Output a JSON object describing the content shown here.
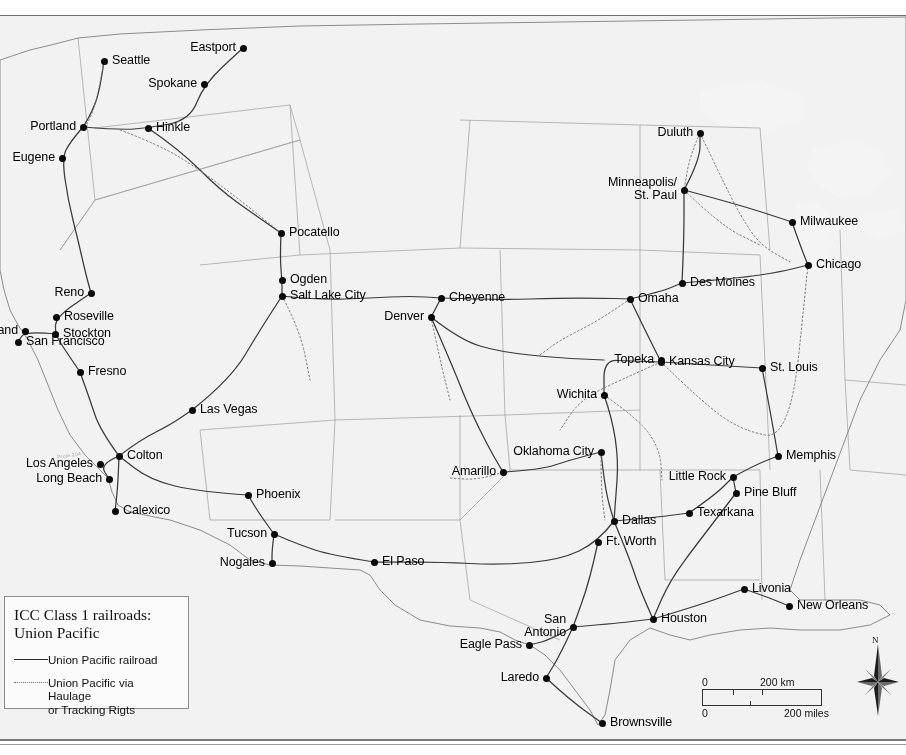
{
  "map": {
    "title": "ICC Class 1 railroads: Union Pacific",
    "projection_note": "United States rail network map with shaded relief",
    "watermark": "Proje 204"
  },
  "legend": {
    "title": "ICC Class 1 railroads:\nUnion Pacific",
    "entries": [
      {
        "key": "solid-line",
        "label": "Union Pacific railroad"
      },
      {
        "key": "dotted-line",
        "label": "Union Pacific via Haulage\nor Tracking Rigts"
      }
    ]
  },
  "scalebar": {
    "km_zero": "0",
    "km_label": "200 km",
    "miles_zero": "0",
    "miles_label": "200 miles"
  },
  "compass": {
    "north_label": "N"
  },
  "colors": {
    "land": "#b9b9b9",
    "water": "#f2f2f2",
    "rail": "#3a3a3a",
    "border": "#8d8d8d",
    "dot": "#0a0a0a"
  },
  "cities": [
    {
      "name": "Seattle",
      "x": 104,
      "y": 61,
      "side": "right",
      "lines": 1
    },
    {
      "name": "Eastport",
      "x": 243,
      "y": 48,
      "side": "left",
      "lines": 1
    },
    {
      "name": "Spokane",
      "x": 204,
      "y": 84,
      "side": "left",
      "lines": 1
    },
    {
      "name": "Portland",
      "x": 83,
      "y": 127,
      "side": "left",
      "lines": 1
    },
    {
      "name": "Hinkle",
      "x": 148,
      "y": 128,
      "side": "right",
      "lines": 1
    },
    {
      "name": "Eugene",
      "x": 62,
      "y": 158,
      "side": "left",
      "lines": 1
    },
    {
      "name": "Duluth",
      "x": 700,
      "y": 133,
      "side": "left",
      "lines": 1
    },
    {
      "name": "Minneapolis/\nSt. Paul",
      "x": 684,
      "y": 190,
      "side": "left",
      "lines": 2
    },
    {
      "name": "Milwaukee",
      "x": 792,
      "y": 222,
      "side": "right",
      "lines": 1
    },
    {
      "name": "Chicago",
      "x": 808,
      "y": 265,
      "side": "right",
      "lines": 1
    },
    {
      "name": "Pocatello",
      "x": 281,
      "y": 233,
      "side": "right",
      "lines": 1
    },
    {
      "name": "Ogden",
      "x": 282,
      "y": 280,
      "side": "right",
      "lines": 1
    },
    {
      "name": "Salt Lake City",
      "x": 282,
      "y": 296,
      "side": "right",
      "lines": 1
    },
    {
      "name": "Cheyenne",
      "x": 441,
      "y": 298,
      "side": "right",
      "lines": 1
    },
    {
      "name": "Denver",
      "x": 431,
      "y": 317,
      "side": "left",
      "lines": 1
    },
    {
      "name": "Des Moines",
      "x": 682,
      "y": 283,
      "side": "right",
      "lines": 1
    },
    {
      "name": "Omaha",
      "x": 630,
      "y": 299,
      "side": "right",
      "lines": 1
    },
    {
      "name": "Reno",
      "x": 91,
      "y": 293,
      "side": "left",
      "lines": 1
    },
    {
      "name": "Roseville",
      "x": 56,
      "y": 317,
      "side": "right",
      "lines": 1
    },
    {
      "name": "Oakland",
      "x": 25,
      "y": 331,
      "side": "left",
      "lines": 1
    },
    {
      "name": "Stockton",
      "x": 55,
      "y": 334,
      "side": "right",
      "lines": 1
    },
    {
      "name": "San Francisco",
      "x": 18,
      "y": 342,
      "side": "right",
      "lines": 1
    },
    {
      "name": "Fresno",
      "x": 80,
      "y": 372,
      "side": "right",
      "lines": 1
    },
    {
      "name": "Topeka",
      "x": 661,
      "y": 360,
      "side": "left",
      "lines": 1
    },
    {
      "name": "Kansas City",
      "x": 661,
      "y": 362,
      "side": "right",
      "lines": 1
    },
    {
      "name": "St. Louis",
      "x": 762,
      "y": 368,
      "side": "right",
      "lines": 1
    },
    {
      "name": "Wichita",
      "x": 604,
      "y": 395,
      "side": "left",
      "lines": 1
    },
    {
      "name": "Las Vegas",
      "x": 192,
      "y": 410,
      "side": "right",
      "lines": 1
    },
    {
      "name": "Memphis",
      "x": 778,
      "y": 456,
      "side": "right",
      "lines": 1
    },
    {
      "name": "Oklahoma City",
      "x": 601,
      "y": 452,
      "side": "left",
      "lines": 1
    },
    {
      "name": "Amarillo",
      "x": 503,
      "y": 472,
      "side": "left",
      "lines": 1
    },
    {
      "name": "Little Rock",
      "x": 733,
      "y": 477,
      "side": "left",
      "lines": 1
    },
    {
      "name": "Colton",
      "x": 119,
      "y": 456,
      "side": "right",
      "lines": 1
    },
    {
      "name": "Los Angeles",
      "x": 100,
      "y": 464,
      "side": "left",
      "lines": 1
    },
    {
      "name": "Long Beach",
      "x": 109,
      "y": 479,
      "side": "left",
      "lines": 1
    },
    {
      "name": "Pine Bluff",
      "x": 736,
      "y": 493,
      "side": "right",
      "lines": 1
    },
    {
      "name": "Phoenix",
      "x": 248,
      "y": 495,
      "side": "right",
      "lines": 1
    },
    {
      "name": "Dallas",
      "x": 614,
      "y": 521,
      "side": "right",
      "lines": 1
    },
    {
      "name": "Texarkana",
      "x": 689,
      "y": 513,
      "side": "right",
      "lines": 1
    },
    {
      "name": "Calexico",
      "x": 115,
      "y": 511,
      "side": "right",
      "lines": 1
    },
    {
      "name": "Tucson",
      "x": 274,
      "y": 534,
      "side": "left",
      "lines": 1
    },
    {
      "name": "Ft. Worth",
      "x": 598,
      "y": 542,
      "side": "right",
      "lines": 1
    },
    {
      "name": "El Paso",
      "x": 374,
      "y": 562,
      "side": "right",
      "lines": 1
    },
    {
      "name": "Nogales",
      "x": 272,
      "y": 563,
      "side": "left",
      "lines": 1
    },
    {
      "name": "Livonia",
      "x": 744,
      "y": 589,
      "side": "right",
      "lines": 1
    },
    {
      "name": "New Orleans",
      "x": 789,
      "y": 606,
      "side": "right",
      "lines": 1
    },
    {
      "name": "San\nAntonio",
      "x": 573,
      "y": 627,
      "side": "left",
      "lines": 2
    },
    {
      "name": "Houston",
      "x": 653,
      "y": 619,
      "side": "right",
      "lines": 1
    },
    {
      "name": "Eagle Pass",
      "x": 529,
      "y": 645,
      "side": "left",
      "lines": 1
    },
    {
      "name": "Laredo",
      "x": 546,
      "y": 678,
      "side": "left",
      "lines": 1
    },
    {
      "name": "Brownsville",
      "x": 602,
      "y": 723,
      "side": "right",
      "lines": 1
    }
  ]
}
